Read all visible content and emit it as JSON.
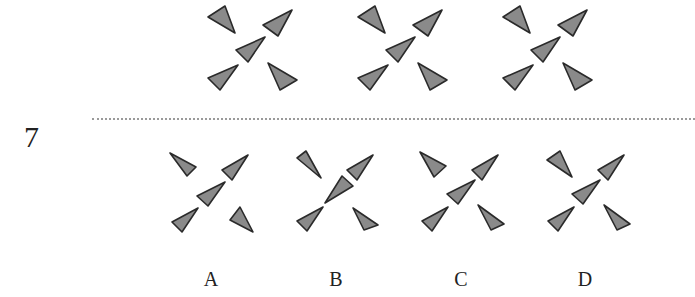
{
  "question": {
    "number": "7"
  },
  "style": {
    "triangle_fill": "#8a8a8a",
    "triangle_stroke": "#2a2a2a",
    "divider_color": "#9a9a9a"
  },
  "sequence": [
    {
      "id": "seq-1",
      "offset": [
        0,
        0
      ]
    },
    {
      "id": "seq-2",
      "offset": [
        150,
        0
      ]
    },
    {
      "id": "seq-3",
      "offset": [
        295,
        0
      ]
    }
  ],
  "options": [
    {
      "label": "A",
      "offset": [
        -35,
        142
      ]
    },
    {
      "label": "B",
      "offset": [
        90,
        142
      ]
    },
    {
      "label": "C",
      "offset": [
        215,
        142
      ]
    },
    {
      "label": "D",
      "offset": [
        340,
        142
      ]
    }
  ]
}
